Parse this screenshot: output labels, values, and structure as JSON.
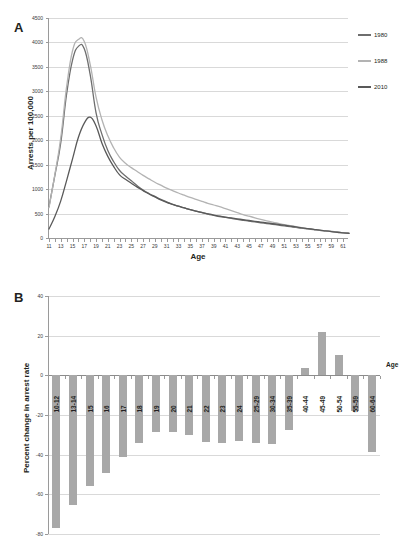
{
  "figure": {
    "panels": [
      {
        "letter": "A"
      },
      {
        "letter": "B"
      }
    ]
  },
  "chart_data": [
    {
      "type": "line",
      "panel": "A",
      "title": "",
      "xlabel": "Age",
      "ylabel": "Arrests per 100,000",
      "xlim": [
        11,
        62
      ],
      "ylim": [
        0,
        4500
      ],
      "ytick_step": 500,
      "yticks": [
        0,
        500,
        1000,
        1500,
        2000,
        2500,
        3000,
        3500,
        4000,
        4500
      ],
      "xticks": [
        11,
        13,
        15,
        17,
        19,
        21,
        23,
        25,
        27,
        29,
        31,
        33,
        35,
        37,
        39,
        41,
        43,
        45,
        47,
        49,
        51,
        53,
        55,
        57,
        59,
        61
      ],
      "grid": true,
      "legend_position": "right",
      "x": [
        11,
        12,
        13,
        14,
        15,
        16,
        17,
        18,
        19,
        20,
        21,
        22,
        23,
        24,
        25,
        26,
        27,
        28,
        29,
        30,
        31,
        32,
        33,
        34,
        35,
        36,
        37,
        38,
        39,
        40,
        41,
        42,
        43,
        44,
        45,
        46,
        47,
        48,
        49,
        50,
        51,
        52,
        53,
        54,
        55,
        56,
        57,
        58,
        59,
        60,
        61,
        62
      ],
      "series": [
        {
          "name": "1980",
          "color": "#6e6e6e",
          "values": [
            640,
            1280,
            1950,
            2950,
            3640,
            3920,
            3870,
            3340,
            2560,
            2120,
            1790,
            1560,
            1380,
            1270,
            1170,
            1070,
            980,
            910,
            850,
            790,
            740,
            690,
            650,
            615,
            580,
            550,
            520,
            490,
            465,
            440,
            420,
            400,
            380,
            362,
            345,
            328,
            312,
            296,
            280,
            264,
            248,
            232,
            216,
            200,
            186,
            172,
            158,
            146,
            134,
            122,
            110,
            100
          ]
        },
        {
          "name": "1988",
          "color": "#b3b3b3",
          "values": [
            620,
            1300,
            2050,
            3100,
            3830,
            4060,
            4020,
            3550,
            2880,
            2420,
            2090,
            1840,
            1650,
            1530,
            1440,
            1360,
            1280,
            1210,
            1140,
            1080,
            1020,
            970,
            920,
            875,
            830,
            790,
            750,
            710,
            675,
            640,
            600,
            560,
            520,
            480,
            445,
            412,
            382,
            352,
            325,
            300,
            275,
            252,
            230,
            210,
            192,
            176,
            160,
            146,
            132,
            118,
            106,
            96
          ]
        },
        {
          "name": "2010",
          "color": "#595959",
          "values": [
            185,
            440,
            760,
            1180,
            1620,
            2060,
            2350,
            2470,
            2290,
            1940,
            1670,
            1460,
            1290,
            1200,
            1120,
            1040,
            970,
            900,
            840,
            780,
            730,
            690,
            650,
            615,
            580,
            550,
            522,
            495,
            470,
            448,
            428,
            410,
            392,
            375,
            358,
            342,
            326,
            310,
            294,
            278,
            262,
            244,
            226,
            208,
            192,
            176,
            160,
            146,
            132,
            118,
            106,
            94
          ]
        }
      ]
    },
    {
      "type": "bar",
      "panel": "B",
      "title": "",
      "xlabel": "Age",
      "ylabel": "Percent change in arrest rate",
      "ylim": [
        -80,
        40
      ],
      "yticks": [
        40,
        20,
        0,
        -20,
        -40,
        -60,
        -80
      ],
      "grid": true,
      "bar_color": "#a8a8a8",
      "categories": [
        "10-12",
        "13-14",
        "15",
        "16",
        "17",
        "18",
        "19",
        "20",
        "21",
        "22",
        "23",
        "24",
        "25-29",
        "30-34",
        "35-39",
        "40-44",
        "45-49",
        "50-54",
        "55-59",
        "60-64"
      ],
      "values": [
        -77,
        -65.5,
        -56,
        -49,
        -41,
        -34,
        -28.5,
        -28.5,
        -30,
        -33.5,
        -34,
        -33,
        -34,
        -34.5,
        -27.5,
        3.5,
        22,
        10.5,
        -18,
        -38.5
      ]
    }
  ]
}
